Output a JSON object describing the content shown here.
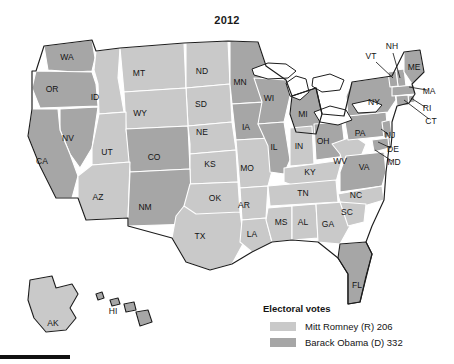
{
  "figure": {
    "title": "2012"
  },
  "colors": {
    "romney": "#c9c9c9",
    "obama": "#a6a6a6",
    "border": "#ffffff",
    "coast": "#1d1d1d",
    "text": "#141414",
    "background": "#ffffff"
  },
  "legend": {
    "title": "Electoral votes",
    "entries": [
      {
        "label": "Mitt Romney (R) 206",
        "color": "#c9c9c9",
        "candidate": "Mitt Romney",
        "party": "R",
        "votes": 206
      },
      {
        "label": "Barack Obama (D) 332",
        "color": "#a6a6a6",
        "candidate": "Barack Obama",
        "party": "D",
        "votes": 332
      }
    ]
  },
  "map": {
    "states": [
      {
        "code": "WA",
        "winner": "obama",
        "lx": 67,
        "ly": 32
      },
      {
        "code": "OR",
        "winner": "obama",
        "lx": 52,
        "ly": 64
      },
      {
        "code": "ID",
        "winner": "romney",
        "lx": 95,
        "ly": 72
      },
      {
        "code": "MT",
        "winner": "romney",
        "lx": 139,
        "ly": 48
      },
      {
        "code": "ND",
        "winner": "romney",
        "lx": 202,
        "ly": 46
      },
      {
        "code": "SD",
        "winner": "romney",
        "lx": 201,
        "ly": 79
      },
      {
        "code": "WY",
        "winner": "romney",
        "lx": 140,
        "ly": 88
      },
      {
        "code": "NV",
        "winner": "obama",
        "lx": 68,
        "ly": 113
      },
      {
        "code": "UT",
        "winner": "romney",
        "lx": 107,
        "ly": 127
      },
      {
        "code": "CA",
        "winner": "obama",
        "lx": 42,
        "ly": 136
      },
      {
        "code": "CO",
        "winner": "obama",
        "lx": 154,
        "ly": 132
      },
      {
        "code": "NE",
        "winner": "romney",
        "lx": 202,
        "ly": 107
      },
      {
        "code": "KS",
        "winner": "romney",
        "lx": 210,
        "ly": 139
      },
      {
        "code": "AZ",
        "winner": "romney",
        "lx": 98,
        "ly": 172
      },
      {
        "code": "NM",
        "winner": "obama",
        "lx": 145,
        "ly": 182
      },
      {
        "code": "TX",
        "winner": "romney",
        "lx": 200,
        "ly": 211
      },
      {
        "code": "OK",
        "winner": "romney",
        "lx": 215,
        "ly": 173
      },
      {
        "code": "MN",
        "winner": "obama",
        "lx": 240,
        "ly": 57
      },
      {
        "code": "IA",
        "winner": "obama",
        "lx": 246,
        "ly": 102
      },
      {
        "code": "MO",
        "winner": "romney",
        "lx": 247,
        "ly": 143
      },
      {
        "code": "AR",
        "winner": "romney",
        "lx": 244,
        "ly": 180
      },
      {
        "code": "LA",
        "winner": "romney",
        "lx": 252,
        "ly": 209
      },
      {
        "code": "WI",
        "winner": "obama",
        "lx": 269,
        "ly": 73
      },
      {
        "code": "IL",
        "winner": "obama",
        "lx": 274,
        "ly": 122
      },
      {
        "code": "MS",
        "winner": "romney",
        "lx": 281,
        "ly": 197
      },
      {
        "code": "AL",
        "winner": "romney",
        "lx": 303,
        "ly": 197
      },
      {
        "code": "MI",
        "winner": "obama",
        "lx": 303,
        "ly": 89
      },
      {
        "code": "IN",
        "winner": "romney",
        "lx": 299,
        "ly": 121
      },
      {
        "code": "KY",
        "winner": "romney",
        "lx": 310,
        "ly": 147
      },
      {
        "code": "TN",
        "winner": "romney",
        "lx": 303,
        "ly": 168
      },
      {
        "code": "OH",
        "winner": "obama",
        "lx": 323,
        "ly": 116
      },
      {
        "code": "WV",
        "winner": "romney",
        "lx": 340,
        "ly": 136
      },
      {
        "code": "GA",
        "winner": "romney",
        "lx": 328,
        "ly": 199
      },
      {
        "code": "VA",
        "winner": "obama",
        "lx": 364,
        "ly": 142
      },
      {
        "code": "NC",
        "winner": "romney",
        "lx": 356,
        "ly": 170
      },
      {
        "code": "SC",
        "winner": "romney",
        "lx": 347,
        "ly": 187
      },
      {
        "code": "FL",
        "winner": "obama",
        "lx": 357,
        "ly": 260
      },
      {
        "code": "PA",
        "winner": "obama",
        "lx": 360,
        "ly": 108
      },
      {
        "code": "NY",
        "winner": "obama",
        "lx": 374,
        "ly": 77
      },
      {
        "code": "AK",
        "winner": "romney",
        "lx": 53,
        "ly": 298
      },
      {
        "code": "HI",
        "winner": "obama",
        "lx": 113,
        "ly": 286
      }
    ],
    "callouts": [
      {
        "code": "NH",
        "winner": "obama",
        "lx": 392,
        "ly": 21,
        "x1": 393,
        "y1": 27,
        "x2": 400,
        "y2": 52
      },
      {
        "code": "VT",
        "winner": "obama",
        "lx": 371,
        "ly": 31,
        "x1": 376,
        "y1": 36,
        "x2": 393,
        "y2": 52
      },
      {
        "code": "ME",
        "winner": "obama",
        "lx": 414,
        "ly": 42,
        "x1": 0,
        "y1": 0,
        "x2": 0,
        "y2": 0
      },
      {
        "code": "MA",
        "winner": "obama",
        "lx": 429,
        "ly": 66,
        "x1": 427,
        "y1": 64,
        "x2": 409,
        "y2": 61
      },
      {
        "code": "RI",
        "winner": "obama",
        "lx": 427,
        "ly": 83,
        "x1": 425,
        "y1": 81,
        "x2": 411,
        "y2": 72
      },
      {
        "code": "CT",
        "winner": "obama",
        "lx": 431,
        "ly": 96,
        "x1": 429,
        "y1": 93,
        "x2": 404,
        "y2": 74
      },
      {
        "code": "NJ",
        "winner": "obama",
        "lx": 390,
        "ly": 110,
        "x1": 388,
        "y1": 108,
        "x2": 381,
        "y2": 103
      },
      {
        "code": "DE",
        "winner": "obama",
        "lx": 393,
        "ly": 124,
        "x1": 391,
        "y1": 122,
        "x2": 378,
        "y2": 116
      },
      {
        "code": "MD",
        "winner": "obama",
        "lx": 394,
        "ly": 137,
        "x1": 392,
        "y1": 135,
        "x2": 375,
        "y2": 124
      }
    ]
  }
}
